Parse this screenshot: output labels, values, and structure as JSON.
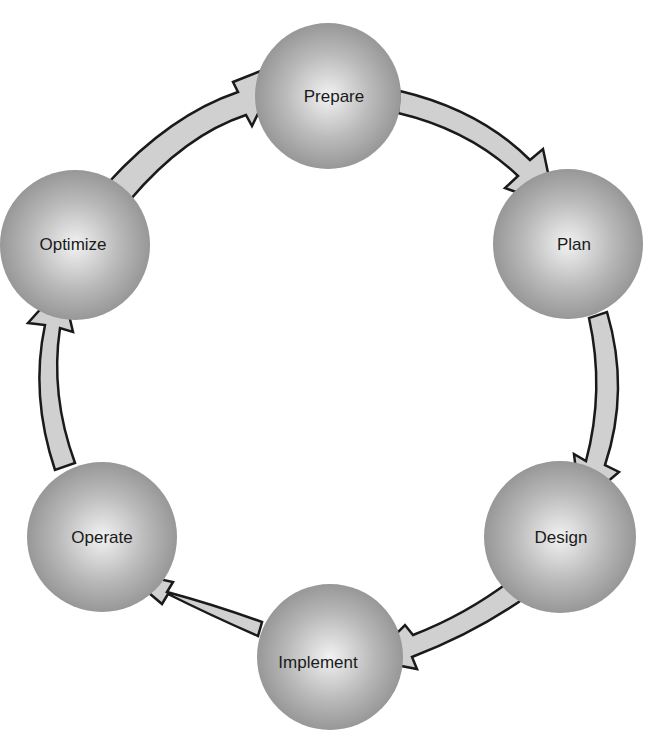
{
  "diagram": {
    "type": "cycle",
    "colors": {
      "node_fill_center": "#f2f2f2",
      "node_fill_edge": "#8f8f8f",
      "arrow_fill": "#d0d0d0",
      "arrow_stroke": "#1a1a1a",
      "text": "#1a1a1a"
    },
    "nodes": [
      {
        "id": "prepare",
        "label": "Prepare",
        "cx": 328,
        "cy": 96,
        "r": 73
      },
      {
        "id": "plan",
        "label": "Plan",
        "cx": 568,
        "cy": 244,
        "r": 75
      },
      {
        "id": "design",
        "label": "Design",
        "cx": 560,
        "cy": 537,
        "r": 76
      },
      {
        "id": "implement",
        "label": "Implement",
        "cx": 330,
        "cy": 657,
        "r": 73
      },
      {
        "id": "operate",
        "label": "Operate",
        "cx": 102,
        "cy": 537,
        "r": 75
      },
      {
        "id": "optimize",
        "label": "Optimize",
        "cx": 75,
        "cy": 245,
        "r": 75
      }
    ],
    "edges": [
      {
        "from": "prepare",
        "to": "plan"
      },
      {
        "from": "plan",
        "to": "design"
      },
      {
        "from": "design",
        "to": "implement"
      },
      {
        "from": "implement",
        "to": "operate"
      },
      {
        "from": "operate",
        "to": "optimize"
      },
      {
        "from": "optimize",
        "to": "prepare"
      }
    ]
  }
}
